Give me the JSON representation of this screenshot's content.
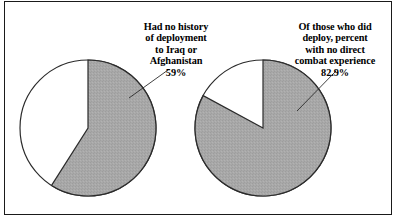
{
  "figure": {
    "background_color": "#ffffff",
    "border_color": "#1a1a1a",
    "slice_fill_color": "#a8a8a8",
    "slice_empty_color": "#ffffff",
    "slice_outline_color": "#2b2b2b",
    "leader_line_color": "#2b2b2b"
  },
  "charts": [
    {
      "id": "left",
      "label_text": "Had no history\nof deployment\nto Iraq or\nAfghanistan",
      "value_text": "59%"
    },
    {
      "id": "right",
      "label_text": "Of those who did\ndeploy, percent\nwith no direct\ncombat experience",
      "value_text": "82.9%"
    }
  ],
  "chart_data": [
    {
      "type": "pie",
      "title": "Had no history of deployment to Iraq or Afghanistan",
      "categories": [
        "Had no history of deployment to Iraq or Afghanistan",
        "Other"
      ],
      "values": [
        59,
        41
      ],
      "value_labels": [
        "59%",
        ""
      ],
      "units": "percent",
      "start_angle_deg": 0,
      "direction": "clockwise",
      "highlighted_slice": "Had no history of deployment to Iraq or Afghanistan",
      "slice_colors": [
        "#a8a8a8",
        "#ffffff"
      ],
      "legend": "none",
      "grid": false,
      "center_px": [
        88,
        128
      ],
      "radius_px": 68
    },
    {
      "type": "pie",
      "title": "Of those who did deploy, percent with no direct combat experience",
      "categories": [
        "Of those who did deploy, percent with no direct combat experience",
        "Other"
      ],
      "values": [
        82.9,
        17.1
      ],
      "value_labels": [
        "82.9%",
        ""
      ],
      "units": "percent",
      "start_angle_deg": 0,
      "direction": "clockwise",
      "highlighted_slice": "Of those who did deploy, percent with no direct combat experience",
      "slice_colors": [
        "#a8a8a8",
        "#ffffff"
      ],
      "legend": "none",
      "grid": false,
      "center_px": [
        263,
        128
      ],
      "radius_px": 68
    }
  ]
}
